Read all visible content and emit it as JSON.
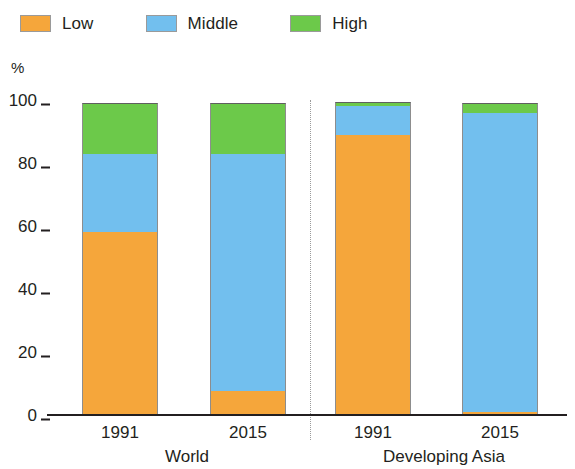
{
  "legend": {
    "items": [
      {
        "label": "Low",
        "color": "#F5A63B",
        "icon": "square-swatch-icon"
      },
      {
        "label": "Middle",
        "color": "#72BFEE",
        "icon": "square-swatch-icon"
      },
      {
        "label": "High",
        "color": "#6CC94A",
        "icon": "square-swatch-icon"
      }
    ]
  },
  "axis": {
    "y_unit": "%",
    "y_ticks": [
      "100",
      "80",
      "60",
      "40",
      "20",
      "0"
    ]
  },
  "groups": [
    {
      "label": "World",
      "years": [
        "1991",
        "2015"
      ]
    },
    {
      "label": "Developing Asia",
      "years": [
        "1991",
        "2015"
      ]
    }
  ],
  "chart_data": {
    "type": "bar",
    "stacked": true,
    "title": "",
    "subtitle": "",
    "xlabel": "",
    "ylabel": "%",
    "ylim": [
      0,
      100
    ],
    "yticks": [
      0,
      20,
      40,
      60,
      80,
      100
    ],
    "grid": false,
    "legend_position": "top-left",
    "groups": [
      "World",
      "Developing Asia"
    ],
    "categories": [
      "1991",
      "2015",
      "1991",
      "2015"
    ],
    "category_groups": [
      "World",
      "World",
      "Developing Asia",
      "Developing Asia"
    ],
    "series": [
      {
        "name": "Low",
        "color": "#F5A63B",
        "values": [
          58,
          7.5,
          89,
          1
        ]
      },
      {
        "name": "Middle",
        "color": "#72BFEE",
        "values": [
          25,
          75.5,
          9,
          95
        ]
      },
      {
        "name": "High",
        "color": "#6CC94A",
        "values": [
          16,
          16,
          1.5,
          3
        ]
      }
    ],
    "totals": [
      99,
      99,
      99.5,
      99
    ],
    "annotations": [
      "dotted vertical divider between World and Developing Asia groups"
    ]
  }
}
